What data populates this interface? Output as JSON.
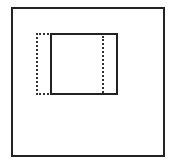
{
  "diagram": {
    "shapes": [
      {
        "id": "outer",
        "type": "rect",
        "style": "solid"
      },
      {
        "id": "inner",
        "type": "rect",
        "style": "solid"
      },
      {
        "id": "shifted-outline",
        "type": "rect",
        "style": "dotted"
      },
      {
        "id": "inner-divider",
        "type": "line",
        "style": "dotted"
      }
    ],
    "colors": {
      "stroke": "#222222",
      "background": "#ffffff"
    }
  }
}
